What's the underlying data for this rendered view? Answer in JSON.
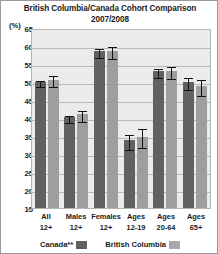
{
  "chart_data": {
    "type": "bar",
    "title": "British Columbia/Canada Cohort Comparison",
    "subtitle": "2007/2008",
    "unit_label": "(%)",
    "xlabel": "",
    "ylabel": "",
    "ylim": [
      15,
      65
    ],
    "ytick_step": 5,
    "yticks": [
      65,
      60,
      55,
      50,
      45,
      40,
      35,
      30,
      25,
      20,
      15
    ],
    "grid": true,
    "legend_position": "bottom",
    "categories": [
      "All 12+",
      "Males 12+",
      "Females 12+",
      "Ages 12-19",
      "Ages 20-64",
      "Ages 65+"
    ],
    "category_lines": [
      [
        "All",
        "12+"
      ],
      [
        "Males",
        "12+"
      ],
      [
        "Females",
        "12+"
      ],
      [
        "Ages",
        "12-19"
      ],
      [
        "Ages",
        "20-64"
      ],
      [
        "Ages",
        "65+"
      ]
    ],
    "series": [
      {
        "name": "Canada**",
        "color": "#616161",
        "values": [
          50.0,
          40.2,
          58.5,
          33.8,
          53.0,
          50.0
        ],
        "err_low": [
          0.8,
          1.0,
          1.2,
          2.0,
          1.2,
          1.8
        ],
        "err_high": [
          0.8,
          1.0,
          1.2,
          2.0,
          1.2,
          1.8
        ]
      },
      {
        "name": "British Columbia",
        "color": "#9e9e9e",
        "values": [
          50.6,
          41.0,
          58.6,
          34.8,
          53.0,
          49.0
        ],
        "err_low": [
          1.5,
          1.6,
          1.6,
          2.6,
          1.6,
          2.2
        ],
        "err_high": [
          1.5,
          1.6,
          1.6,
          2.6,
          1.6,
          2.2
        ]
      }
    ]
  },
  "legend": {
    "items": [
      {
        "label": "Canada**",
        "color": "#616161"
      },
      {
        "label": "British Columbia",
        "color": "#a8a8a8"
      }
    ]
  }
}
